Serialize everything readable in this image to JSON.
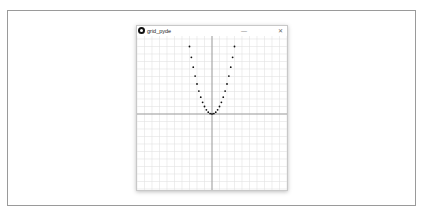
{
  "window": {
    "title": "grid_pyde",
    "minimize_label": "—",
    "close_label": "✕"
  },
  "icons": {
    "app": "processing-app-icon",
    "minimize": "minimize-icon",
    "close": "close-icon"
  },
  "colors": {
    "grid": "#e2e2e2",
    "axis": "#8a8a8a",
    "dot": "#111111",
    "frame": "#9a9a9a"
  },
  "chart_data": {
    "type": "scatter",
    "title": "",
    "xlabel": "",
    "ylabel": "",
    "grid": true,
    "grid_step": 1,
    "xlim": [
      -10,
      10
    ],
    "ylim": [
      -10,
      10
    ],
    "function": "y = x^2",
    "x": [
      -3,
      -2.75,
      -2.5,
      -2.25,
      -2,
      -1.75,
      -1.5,
      -1.25,
      -1,
      -0.75,
      -0.5,
      -0.25,
      0,
      0.25,
      0.5,
      0.75,
      1,
      1.25,
      1.5,
      1.75,
      2,
      2.25,
      2.5,
      2.75,
      3
    ],
    "y": [
      9,
      7.5625,
      6.25,
      5.0625,
      4,
      3.0625,
      2.25,
      1.5625,
      1,
      0.5625,
      0.25,
      0.0625,
      0,
      0.0625,
      0.25,
      0.5625,
      1,
      1.5625,
      2.25,
      3.0625,
      4,
      5.0625,
      6.25,
      7.5625,
      9
    ]
  }
}
